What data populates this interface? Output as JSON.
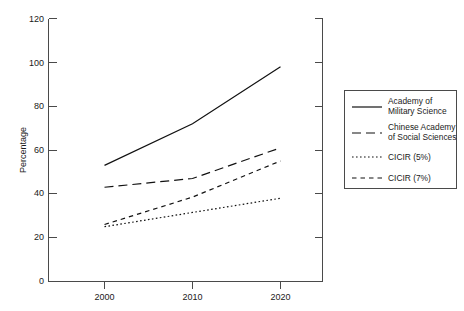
{
  "chart_data": {
    "type": "line",
    "title": "",
    "xlabel": "",
    "ylabel": "Percentage",
    "x": [
      2000,
      2010,
      2020
    ],
    "xtick_labels": [
      "2000",
      "2010",
      "2020"
    ],
    "ytick_labels": [
      "0",
      "20",
      "40",
      "60",
      "80",
      "100",
      "120"
    ],
    "yticks": [
      0,
      20,
      40,
      60,
      80,
      100,
      120
    ],
    "ylim": [
      0,
      120
    ],
    "xlim": [
      1996,
      2024
    ],
    "grid": false,
    "legend_position": "right",
    "series": [
      {
        "name": "Academy of Military Science",
        "legend_line1": "Academy of",
        "legend_line2": "Military Science",
        "style": "solid",
        "values": [
          53,
          72,
          98
        ]
      },
      {
        "name": "Chinese Academy of Social Sciences",
        "legend_line1": "Chinese Academy",
        "legend_line2": "of Social Sciences",
        "style": "long-dash",
        "values": [
          43,
          47,
          61
        ]
      },
      {
        "name": "CICIR (5%)",
        "legend_line1": "CICIR (5%)",
        "legend_line2": "",
        "style": "dotted",
        "values": [
          25,
          31.5,
          38
        ]
      },
      {
        "name": "CICIR (7%)",
        "legend_line1": "CICIR (7%)",
        "legend_line2": "",
        "style": "dashed",
        "values": [
          26,
          38.5,
          55
        ]
      }
    ]
  },
  "colors": {
    "line": "#111111",
    "axis": "#4a4a4a",
    "background": "#ffffff",
    "text": "#1a1a1a"
  }
}
